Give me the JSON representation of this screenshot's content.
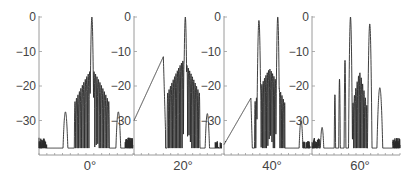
{
  "chart_data": {
    "type": "line",
    "title": "",
    "ylabel": "",
    "xlabel": "",
    "ylim": [
      -38,
      0
    ],
    "yticks": [
      0,
      -10,
      -20,
      -30
    ],
    "ytick_labels": [
      "0",
      "−10",
      "−20",
      "−30"
    ],
    "grid": false,
    "legend": "none",
    "panels": [
      {
        "name": "steer-0",
        "xlabel": "0°",
        "center": 0,
        "xlim": [
          -27,
          21
        ],
        "features": {
          "main_lobe": {
            "x": 0,
            "y": 0
          },
          "near_sidelobes_peak": -15,
          "ripple_region": [
            -9,
            9
          ],
          "ripple_floor": -38,
          "outer_lobes": [
            {
              "x": -13.5,
              "y": -27.5
            },
            {
              "x": 13.5,
              "y": -27.5
            }
          ],
          "edge_value": -35
        }
      },
      {
        "name": "steer-20",
        "xlabel": "20°",
        "center": 20,
        "xlim": [
          -8,
          40
        ],
        "features": {
          "main_lobe": {
            "x": 20,
            "y": 0
          },
          "grating_ramp": {
            "from": {
              "x": -8,
              "y": -30
            },
            "to": {
              "x": 8,
              "y": -11.5
            }
          },
          "near_sidelobes_peak": -12.5,
          "ripple_region": [
            10,
            28
          ],
          "ripple_floor": -37,
          "outer_lobes": [
            {
              "x": 32,
              "y": -28
            }
          ],
          "edge_value": -36
        }
      },
      {
        "name": "steer-40",
        "xlabel": "40°",
        "center": 40,
        "xlim": [
          12,
          60
        ],
        "features": {
          "main_lobe": {
            "x": 42,
            "y": 0
          },
          "second_lobe": {
            "x": 31.5,
            "y": -1
          },
          "grating_ramp": {
            "from": {
              "x": 12,
              "y": -37
            },
            "to": {
              "x": 27,
              "y": -23.5
            }
          },
          "near_sidelobes_peak": -15,
          "ripple_region": [
            29,
            46
          ],
          "ripple_floor": -34,
          "outer_lobes": [
            {
              "x": 55,
              "y": -30
            }
          ],
          "edge_value": -36
        }
      },
      {
        "name": "steer-60",
        "xlabel": "60°",
        "center": 60,
        "xlim": [
          33,
          81
        ],
        "features": {
          "main_lobe": {
            "x": 54,
            "y": 0
          },
          "second_lobe": {
            "x": 64.5,
            "y": -2
          },
          "pre_lobes": [
            {
              "x": 45.5,
              "y": -22.5
            },
            {
              "x": 48,
              "y": -18
            },
            {
              "x": 51,
              "y": -12.5
            }
          ],
          "near_sidelobes_peak": -16,
          "ripple_region": [
            55,
            63
          ],
          "ripple_floor": -30,
          "outer_lobes": [
            {
              "x": 38.5,
              "y": -32
            },
            {
              "x": 70,
              "y": -20.5
            }
          ],
          "edge_value": -35
        }
      }
    ]
  }
}
